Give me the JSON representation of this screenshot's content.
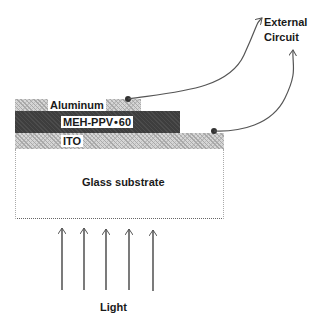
{
  "diagram": {
    "layers": {
      "aluminum": "Aluminum",
      "active": "MEH-PPV • 60",
      "ito": "ITO",
      "substrate": "Glass substrate"
    },
    "external_circuit": [
      "External",
      "Circuit"
    ],
    "light_label": "Light",
    "light_arrow_count": 5,
    "colors": {
      "active_layer": "#3e3e3e",
      "hatched_layer": "#d6d6d6",
      "line": "#555555"
    }
  }
}
